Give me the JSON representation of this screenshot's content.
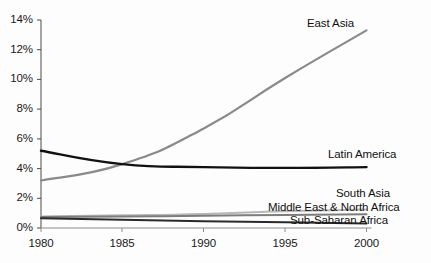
{
  "chart_data": {
    "type": "line",
    "title": "",
    "subtitle": "",
    "xlabel": "",
    "ylabel": "",
    "x": [
      1980,
      1985,
      1990,
      1995,
      2000
    ],
    "xlim": [
      1980,
      2000
    ],
    "ylim": [
      0,
      14
    ],
    "ytick_labels": [
      "0%",
      "2%",
      "4%",
      "6%",
      "8%",
      "10%",
      "12%",
      "14%"
    ],
    "ytick_values": [
      0,
      2,
      4,
      6,
      8,
      10,
      12,
      14
    ],
    "xtick_labels": [
      "1980",
      "1985",
      "1990",
      "1995",
      "2000"
    ],
    "grid": false,
    "legend": "inline-labels-right",
    "series": [
      {
        "name": "East Asia",
        "color": "#8a8a8a",
        "width": 2.2,
        "values": [
          3.2,
          4.3,
          6.7,
          10.1,
          13.3
        ]
      },
      {
        "name": "Latin America",
        "color": "#111111",
        "width": 2.4,
        "values": [
          5.2,
          4.3,
          4.1,
          4.05,
          4.1
        ]
      },
      {
        "name": "South Asia",
        "color": "#b8b8b8",
        "width": 2.0,
        "values": [
          0.78,
          0.85,
          0.95,
          1.12,
          1.25
        ]
      },
      {
        "name": "Middle East & North Africa",
        "color": "#7d7d7d",
        "width": 2.0,
        "values": [
          0.74,
          0.78,
          0.82,
          0.88,
          0.92
        ]
      },
      {
        "name": "Sub-Saharan Africa",
        "color": "#2b2b2b",
        "width": 2.0,
        "values": [
          0.66,
          0.56,
          0.46,
          0.38,
          0.3
        ]
      }
    ],
    "series_label_positions": [
      {
        "name": "East Asia",
        "x": 307,
        "y": 17
      },
      {
        "name": "Latin America",
        "x": 328,
        "y": 148
      },
      {
        "name": "South Asia",
        "x": 336,
        "y": 187
      },
      {
        "name": "Middle East & North Africa",
        "x": 268,
        "y": 201
      },
      {
        "name": "Sub-Saharan Africa",
        "x": 290,
        "y": 214
      }
    ]
  },
  "axes": {
    "y_ticks": [
      {
        "label": "14%",
        "y": 20
      },
      {
        "label": "12%",
        "y": 49.7
      },
      {
        "label": "10%",
        "y": 79.4
      },
      {
        "label": "8%",
        "y": 109.1
      },
      {
        "label": "6%",
        "y": 138.9
      },
      {
        "label": "4%",
        "y": 168.6
      },
      {
        "label": "2%",
        "y": 198.3
      },
      {
        "label": "0%",
        "y": 228
      }
    ],
    "x_ticks": [
      {
        "label": "1980",
        "x": 41
      },
      {
        "label": "1985",
        "x": 122
      },
      {
        "label": "1990",
        "x": 203.5
      },
      {
        "label": "1995",
        "x": 285
      },
      {
        "label": "2000",
        "x": 366.5
      }
    ]
  }
}
